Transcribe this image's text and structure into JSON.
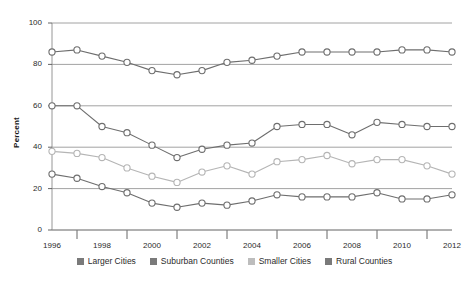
{
  "chart_data": {
    "type": "line",
    "title": "",
    "xlabel": "",
    "ylabel": "Percent",
    "ylim": [
      0,
      100
    ],
    "yticks": [
      0,
      20,
      40,
      60,
      80,
      100
    ],
    "xlim": [
      1996,
      2012
    ],
    "xticks": [
      1996,
      1998,
      2000,
      2002,
      2004,
      2006,
      2008,
      2010,
      2012
    ],
    "minor_xticks": [
      1997,
      1999,
      2001,
      2003,
      2005,
      2007,
      2009,
      2011
    ],
    "grid": "horizontal",
    "legend_position": "bottom",
    "marker": "open-circle",
    "x": [
      1996,
      1997,
      1998,
      1999,
      2000,
      2001,
      2002,
      2003,
      2004,
      2005,
      2006,
      2007,
      2008,
      2009,
      2010,
      2011,
      2012
    ],
    "series": [
      {
        "name": "Larger Cities",
        "color": "#6e6e6e",
        "values": [
          86,
          87,
          84,
          81,
          77,
          75,
          77,
          81,
          82,
          84,
          86,
          86,
          86,
          86,
          87,
          87,
          86
        ]
      },
      {
        "name": "Suburban Counties",
        "color": "#6e6e6e",
        "values": [
          60,
          60,
          50,
          47,
          41,
          35,
          39,
          41,
          42,
          50,
          51,
          51,
          46,
          52,
          51,
          50,
          50
        ]
      },
      {
        "name": "Smaller Cities",
        "color": "#b5b5b5",
        "values": [
          38,
          37,
          35,
          30,
          26,
          23,
          28,
          31,
          27,
          33,
          34,
          36,
          32,
          34,
          34,
          31,
          27
        ]
      },
      {
        "name": "Rural Counties",
        "color": "#6e6e6e",
        "values": [
          27,
          25,
          21,
          18,
          13,
          11,
          13,
          12,
          14,
          17,
          16,
          16,
          16,
          18,
          15,
          15,
          17
        ]
      }
    ]
  },
  "legend": {
    "items": [
      {
        "label": "Larger Cities",
        "color": "#7a7a7a"
      },
      {
        "label": "Suburban Counties",
        "color": "#7a7a7a"
      },
      {
        "label": "Smaller Cities",
        "color": "#bdbdbd"
      },
      {
        "label": "Rural Counties",
        "color": "#7a7a7a"
      }
    ]
  },
  "axes": {
    "y_title": "Percent",
    "y_tick_labels": [
      "0",
      "20",
      "40",
      "60",
      "80",
      "100"
    ],
    "x_tick_labels": [
      "1996",
      "1998",
      "2000",
      "2002",
      "2004",
      "2006",
      "2008",
      "2010",
      "2012"
    ]
  }
}
